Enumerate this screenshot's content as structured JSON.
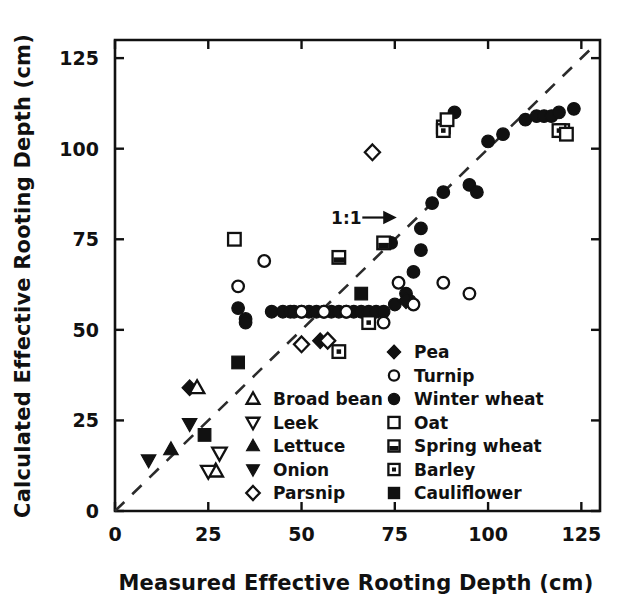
{
  "chart_data": {
    "type": "scatter",
    "title": "",
    "xlabel": "Measured Effective Rooting Depth (cm)",
    "ylabel": "Calculated Effective Rooting Depth (cm)",
    "xlim": [
      0,
      130
    ],
    "ylim": [
      0,
      130
    ],
    "xticks": [
      0,
      25,
      50,
      75,
      100,
      125
    ],
    "yticks": [
      0,
      25,
      50,
      75,
      100,
      125
    ],
    "xticklabels": [
      "0",
      "25",
      "50",
      "75",
      "100",
      "125"
    ],
    "yticklabels": [
      "0",
      "25",
      "50",
      "75",
      "100",
      "125"
    ],
    "grid": false,
    "legend_position": "lower-right-inside",
    "annotations": [
      {
        "text": "1:1",
        "x": 62,
        "y": 81,
        "note": "label with arrow pointing to the 1:1 dashed line"
      }
    ],
    "reference_line": {
      "label": "1:1",
      "style": "dashed",
      "from": [
        0,
        0
      ],
      "to": [
        128,
        128
      ]
    },
    "series": [
      {
        "name": "Pea",
        "marker": "filled-diamond",
        "points": [
          [
            20,
            34
          ],
          [
            55,
            47
          ],
          [
            78,
            58
          ]
        ]
      },
      {
        "name": "Turnip",
        "marker": "open-circle",
        "points": [
          [
            33,
            62
          ],
          [
            40,
            69
          ],
          [
            50,
            55
          ],
          [
            56,
            55
          ],
          [
            62,
            55
          ],
          [
            72,
            52
          ],
          [
            76,
            63
          ],
          [
            80,
            57
          ],
          [
            88,
            63
          ],
          [
            95,
            60
          ]
        ]
      },
      {
        "name": "Winter wheat",
        "marker": "filled-circle",
        "points": [
          [
            33,
            56
          ],
          [
            35,
            53
          ],
          [
            35,
            52
          ],
          [
            42,
            55
          ],
          [
            45,
            55
          ],
          [
            47,
            55
          ],
          [
            48,
            55
          ],
          [
            50,
            55
          ],
          [
            52,
            55
          ],
          [
            54,
            55
          ],
          [
            56,
            55
          ],
          [
            58,
            55
          ],
          [
            60,
            55
          ],
          [
            62,
            55
          ],
          [
            64,
            55
          ],
          [
            66,
            55
          ],
          [
            68,
            55
          ],
          [
            70,
            55
          ],
          [
            72,
            55
          ],
          [
            75,
            57
          ],
          [
            78,
            60
          ],
          [
            79,
            58
          ],
          [
            80,
            66
          ],
          [
            82,
            78
          ],
          [
            85,
            85
          ],
          [
            88,
            88
          ],
          [
            91,
            110
          ],
          [
            95,
            90
          ],
          [
            97,
            88
          ],
          [
            100,
            102
          ],
          [
            104,
            104
          ],
          [
            110,
            108
          ],
          [
            113,
            109
          ],
          [
            115,
            109
          ],
          [
            117,
            109
          ],
          [
            119,
            110
          ],
          [
            123,
            111
          ],
          [
            74,
            74
          ],
          [
            82,
            72
          ]
        ]
      },
      {
        "name": "Oat",
        "marker": "open-square",
        "points": [
          [
            32,
            75
          ],
          [
            89,
            108
          ],
          [
            121,
            104
          ]
        ]
      },
      {
        "name": "Spring wheat",
        "marker": "half-filled-square",
        "points": [
          [
            60,
            70
          ],
          [
            72,
            74
          ],
          [
            88,
            106
          ],
          [
            120,
            105
          ]
        ]
      },
      {
        "name": "Barley",
        "marker": "dotted-square",
        "points": [
          [
            60,
            44
          ],
          [
            68,
            52
          ],
          [
            88,
            105
          ],
          [
            119,
            105
          ]
        ]
      },
      {
        "name": "Cauliflower",
        "marker": "filled-square",
        "points": [
          [
            24,
            21
          ],
          [
            33,
            41
          ],
          [
            66,
            60
          ]
        ]
      },
      {
        "name": "Broad bean",
        "marker": "open-triangle-up",
        "points": [
          [
            22,
            34
          ],
          [
            27,
            11
          ]
        ]
      },
      {
        "name": "Leek",
        "marker": "open-triangle-down",
        "points": [
          [
            25,
            11
          ],
          [
            28,
            16
          ]
        ]
      },
      {
        "name": "Lettuce",
        "marker": "filled-triangle-up",
        "points": [
          [
            15,
            17
          ]
        ]
      },
      {
        "name": "Onion",
        "marker": "filled-triangle-down",
        "points": [
          [
            9,
            14
          ],
          [
            20,
            24
          ]
        ]
      },
      {
        "name": "Parsnip",
        "marker": "open-diamond",
        "points": [
          [
            50,
            46
          ],
          [
            57,
            47
          ],
          [
            69,
            99
          ]
        ]
      }
    ],
    "legend_columns": [
      {
        "column": "left",
        "entries": [
          {
            "label": "Broad bean",
            "marker": "open-triangle-up"
          },
          {
            "label": "Leek",
            "marker": "open-triangle-down"
          },
          {
            "label": "Lettuce",
            "marker": "filled-triangle-up"
          },
          {
            "label": "Onion",
            "marker": "filled-triangle-down"
          },
          {
            "label": "Parsnip",
            "marker": "open-diamond"
          }
        ]
      },
      {
        "column": "right",
        "entries": [
          {
            "label": "Pea",
            "marker": "filled-diamond"
          },
          {
            "label": "Turnip",
            "marker": "open-circle"
          },
          {
            "label": "Winter wheat",
            "marker": "filled-circle"
          },
          {
            "label": "Oat",
            "marker": "open-square"
          },
          {
            "label": "Spring wheat",
            "marker": "half-filled-square"
          },
          {
            "label": "Barley",
            "marker": "dotted-square"
          },
          {
            "label": "Cauliflower",
            "marker": "filled-square"
          }
        ]
      }
    ],
    "colors": {
      "ink": "#111111",
      "background": "#ffffff"
    }
  }
}
